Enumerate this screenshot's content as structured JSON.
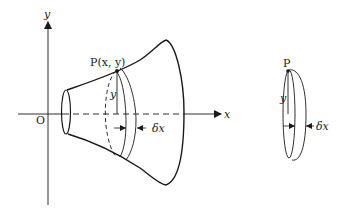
{
  "figure": {
    "axes": {
      "x_label": "x",
      "y_label": "y",
      "origin_label": "O"
    },
    "main_solid": {
      "point_label": "P(x, y)",
      "radius_label": "y",
      "thickness_label": "δx"
    },
    "disc": {
      "point_label": "P",
      "radius_label": "y",
      "thickness_label": "δx"
    },
    "colors": {
      "stroke": "#1a1a1a",
      "background": "#ffffff"
    }
  }
}
